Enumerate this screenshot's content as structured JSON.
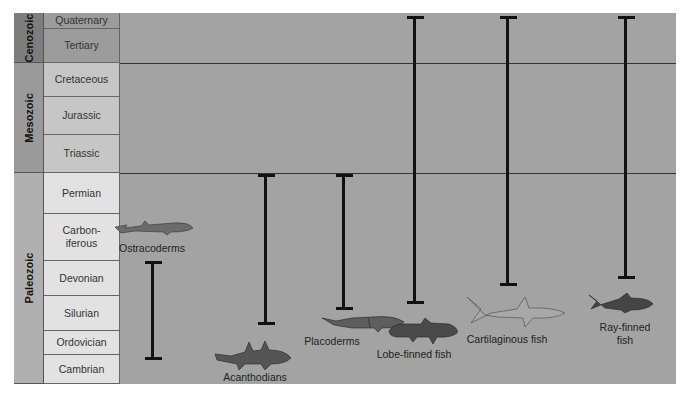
{
  "eras": [
    {
      "name": "Cenozoic",
      "top": 0,
      "bottom": 50,
      "color": "#7d7d7d"
    },
    {
      "name": "Mesozoic",
      "top": 50,
      "bottom": 160,
      "color": "#9a9a9a"
    },
    {
      "name": "Paleozoic",
      "top": 160,
      "bottom": 371,
      "color": "#b0b0b0"
    }
  ],
  "periods": [
    {
      "name": "Quaternary",
      "top": 0,
      "bottom": 16,
      "color": "#9c9c9c"
    },
    {
      "name": "Tertiary",
      "top": 16,
      "bottom": 50,
      "color": "#9c9c9c"
    },
    {
      "name": "Cretaceous",
      "top": 50,
      "bottom": 84,
      "color": "#c6c6c6"
    },
    {
      "name": "Jurassic",
      "top": 84,
      "bottom": 122,
      "color": "#c6c6c6"
    },
    {
      "name": "Triassic",
      "top": 122,
      "bottom": 160,
      "color": "#c6c6c6"
    },
    {
      "name": "Permian",
      "top": 160,
      "bottom": 201,
      "color": "#e2e2e2"
    },
    {
      "name": "Carbon-\niferous",
      "top": 201,
      "bottom": 248,
      "color": "#e2e2e2"
    },
    {
      "name": "Devonian",
      "top": 248,
      "bottom": 283,
      "color": "#e2e2e2"
    },
    {
      "name": "Silurian",
      "top": 283,
      "bottom": 318,
      "color": "#e2e2e2"
    },
    {
      "name": "Ordovician",
      "top": 318,
      "bottom": 342,
      "color": "#e2e2e2"
    },
    {
      "name": "Cambrian",
      "top": 342,
      "bottom": 371,
      "color": "#e2e2e2"
    }
  ],
  "groups": [
    {
      "name": "Ostracoderms",
      "x": 138,
      "top": 249,
      "bottom": 347,
      "label_y": 229,
      "fish_y": 206,
      "fish": "ostracoderm"
    },
    {
      "name": "Acanthodians",
      "x": 251,
      "top": 162,
      "bottom": 312,
      "label_y": 358,
      "fish_y": 325,
      "fish": "acanthodian"
    },
    {
      "name": "Placoderms",
      "x": 329,
      "top": 162,
      "bottom": 297,
      "label_y": 322,
      "fish_y": 300,
      "fish": "placoderm"
    },
    {
      "name": "Lobe-finned fish",
      "x": 400,
      "top": 4,
      "bottom": 291,
      "label_y": 335,
      "fish_y": 303,
      "fish": "lobe"
    },
    {
      "name": "Cartilaginous fish",
      "x": 493,
      "top": 4,
      "bottom": 273,
      "label_y": 320,
      "fish_y": 282,
      "fish": "shark"
    },
    {
      "name": "Ray-finned\nfish",
      "x": 611,
      "top": 4,
      "bottom": 266,
      "label_y": 308,
      "fish_y": 278,
      "fish": "ray"
    }
  ]
}
